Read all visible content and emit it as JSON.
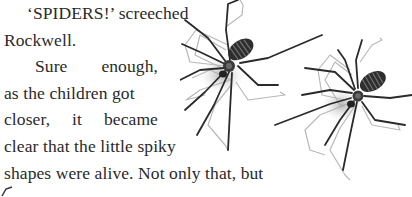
{
  "page": {
    "background": "#ffffff",
    "text_color": "#2a2a2a"
  },
  "story": {
    "lines": [
      "‘SPIDERS!’ screeched",
      "Rockwell.",
      "Sure enough,",
      "as the children got",
      "closer, it became",
      "clear that the little spiky",
      "shapes were alive. Not only that, but"
    ],
    "line3_words": [
      "Sure",
      "enough,"
    ],
    "line5_words": [
      "closer,",
      "it",
      "became"
    ]
  },
  "illustration": {
    "subject": "two spiders with long legs and shadows",
    "icon": "spider-icon",
    "count": 2
  }
}
